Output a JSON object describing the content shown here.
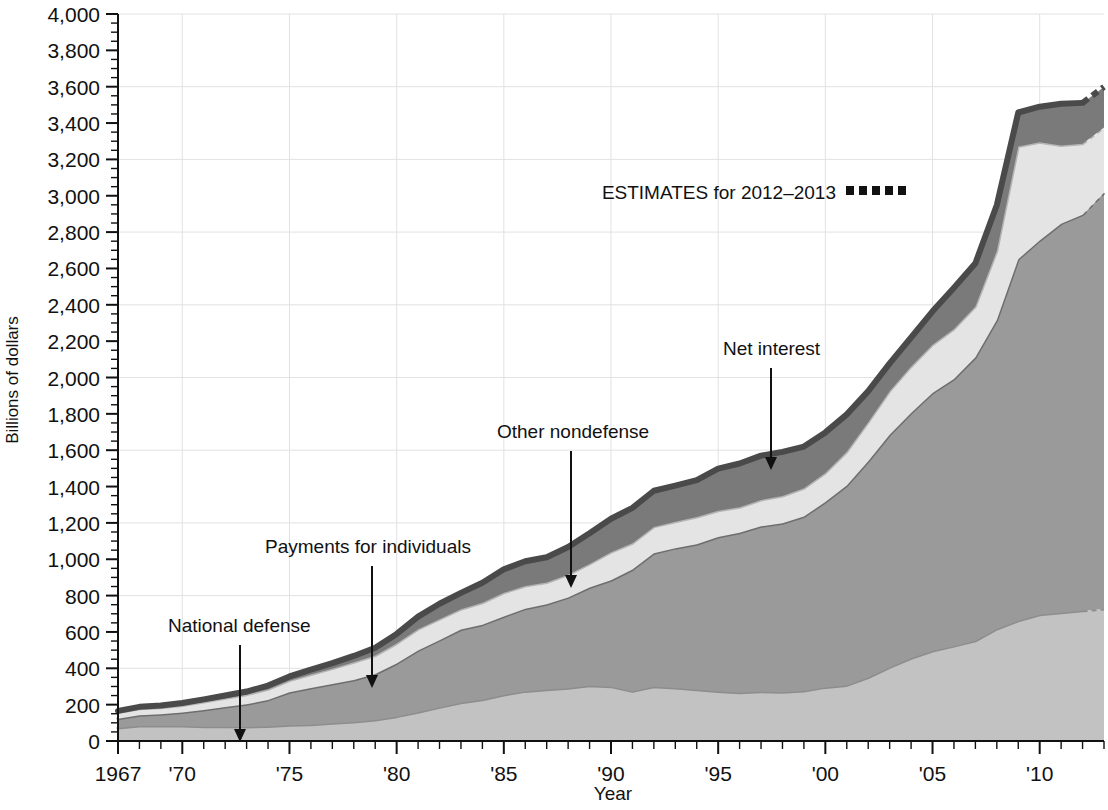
{
  "chart_data": {
    "type": "area",
    "stacked": true,
    "title": "",
    "xlabel": "Year",
    "ylabel": "Billions of dollars",
    "xlim": [
      1967,
      2013
    ],
    "ylim": [
      0,
      4000
    ],
    "ytick_step": 200,
    "yticks": [
      0,
      200,
      400,
      600,
      800,
      1000,
      1200,
      1400,
      1600,
      1800,
      2000,
      2200,
      2400,
      2600,
      2800,
      3000,
      3200,
      3400,
      3600,
      3800,
      4000
    ],
    "ytick_labels": [
      "0",
      "200",
      "400",
      "600",
      "800",
      "1,000",
      "1,200",
      "1,400",
      "1,600",
      "1,800",
      "2,000",
      "2,200",
      "2,400",
      "2,600",
      "2,800",
      "3,000",
      "3,200",
      "3,400",
      "3,600",
      "3,800",
      "4,000"
    ],
    "xticks": [
      1967,
      1970,
      1975,
      1980,
      1985,
      1990,
      1995,
      2000,
      2005,
      2010
    ],
    "xtick_labels": [
      "1967",
      "'70",
      "'75",
      "'80",
      "'85",
      "'90",
      "'95",
      "'00",
      "'05",
      "'10"
    ],
    "grid": {
      "horizontal_every": 400,
      "vertical_at_xticks": true,
      "color": "#e2e2e2"
    },
    "legend": {
      "position": "inside-top-right",
      "estimates_label": "ESTIMATES for 2012–2013",
      "estimates_marker": "dashed"
    },
    "estimate_start_year": 2012,
    "x": [
      1967,
      1968,
      1969,
      1970,
      1971,
      1972,
      1973,
      1974,
      1975,
      1976,
      1977,
      1978,
      1979,
      1980,
      1981,
      1982,
      1983,
      1984,
      1985,
      1986,
      1987,
      1988,
      1989,
      1990,
      1991,
      1992,
      1993,
      1994,
      1995,
      1996,
      1997,
      1998,
      1999,
      2000,
      2001,
      2002,
      2003,
      2004,
      2005,
      2006,
      2007,
      2008,
      2009,
      2010,
      2011,
      2012,
      2013
    ],
    "series": [
      {
        "name": "National defense",
        "order": 1,
        "color": "#c2c2c2",
        "line_color": "#8d8d8d",
        "values": [
          71,
          82,
          82,
          82,
          79,
          79,
          77,
          80,
          87,
          90,
          97,
          104,
          116,
          134,
          158,
          185,
          210,
          227,
          253,
          273,
          282,
          290,
          304,
          299,
          273,
          298,
          291,
          282,
          272,
          266,
          271,
          268,
          275,
          295,
          306,
          349,
          405,
          455,
          495,
          522,
          551,
          616,
          661,
          694,
          706,
          716,
          726
        ]
      },
      {
        "name": "Payments for individuals",
        "order": 2,
        "color": "#9a9a9a",
        "line_color": "#6e6e6e",
        "values": [
          52,
          59,
          65,
          75,
          92,
          108,
          125,
          146,
          181,
          202,
          217,
          232,
          252,
          292,
          340,
          370,
          403,
          413,
          432,
          455,
          470,
          500,
          540,
          585,
          670,
          735,
          770,
          800,
          850,
          880,
          910,
          930,
          960,
          1020,
          1100,
          1190,
          1280,
          1350,
          1420,
          1470,
          1560,
          1700,
          1990,
          2060,
          2140,
          2180,
          2290
        ]
      },
      {
        "name": "Other nondefense",
        "order": 3,
        "color": "#e4e4e4",
        "line_color": "#b4b4b4",
        "values": [
          33,
          36,
          36,
          38,
          43,
          48,
          53,
          58,
          64,
          74,
          84,
          97,
          102,
          110,
          117,
          115,
          112,
          120,
          130,
          125,
          120,
          125,
          130,
          155,
          145,
          145,
          145,
          150,
          145,
          140,
          145,
          150,
          155,
          160,
          185,
          215,
          240,
          255,
          265,
          275,
          280,
          380,
          620,
          540,
          430,
          390,
          360
        ]
      },
      {
        "name": "Net interest",
        "order": 4,
        "color": "#7a7a7a",
        "line_color": "#4a4a4a",
        "values": [
          10,
          11,
          12,
          14,
          15,
          15,
          17,
          21,
          23,
          27,
          30,
          35,
          43,
          53,
          69,
          85,
          90,
          111,
          130,
          136,
          139,
          152,
          169,
          184,
          195,
          199,
          199,
          203,
          232,
          241,
          244,
          243,
          230,
          223,
          206,
          171,
          153,
          160,
          184,
          227,
          238,
          253,
          187,
          196,
          230,
          225,
          223
        ]
      }
    ],
    "annotations": [
      {
        "label": "National defense",
        "text_x": 168,
        "text_y": 632,
        "arrow_x": 240,
        "arrow_y1": 645,
        "arrow_y2": 742
      },
      {
        "label": "Payments for individuals",
        "text_x": 265,
        "text_y": 553,
        "arrow_x": 372,
        "arrow_y1": 566,
        "arrow_y2": 688
      },
      {
        "label": "Other nondefense",
        "text_x": 497,
        "text_y": 438,
        "arrow_x": 571,
        "arrow_y1": 451,
        "arrow_y2": 588
      },
      {
        "label": "Net interest",
        "text_x": 723,
        "text_y": 355,
        "arrow_x": 771,
        "arrow_y1": 368,
        "arrow_y2": 470
      }
    ]
  }
}
